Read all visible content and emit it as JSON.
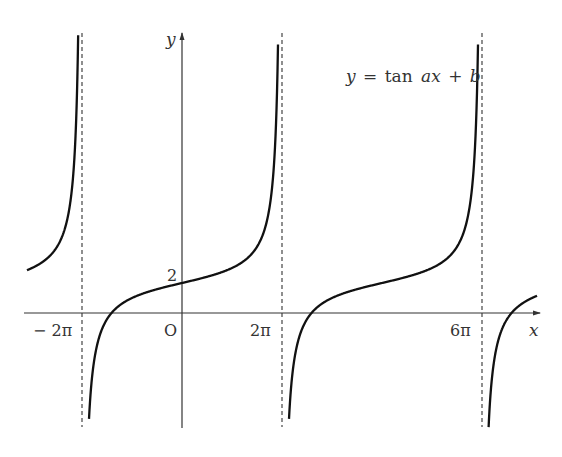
{
  "chart_data": {
    "type": "line",
    "title": "",
    "function_label": "y = tan ax + b",
    "function_parts": {
      "y": "y",
      "eq": "=",
      "tan": "tan",
      "ax": "ax",
      "plus": "+",
      "b": "b"
    },
    "xlabel": "x",
    "ylabel": "y",
    "origin_label": "O",
    "x_ticks": [
      {
        "value_pi": -2,
        "label": "− 2π"
      },
      {
        "value_pi": 2,
        "label": "2π"
      },
      {
        "value_pi": 6,
        "label": "6π"
      }
    ],
    "y_ticks": [
      {
        "value": 2,
        "label": "2"
      }
    ],
    "asymptotes_pi": [
      -2,
      2,
      6
    ],
    "function": {
      "a": 0.25,
      "b": 2,
      "period_pi": 4
    },
    "xlim_pi": [
      -3.1,
      7.1
    ],
    "grid": false,
    "legend": "none",
    "colors": {
      "curve": "#111111",
      "axis": "#333333",
      "asymptote": "#333333"
    }
  }
}
